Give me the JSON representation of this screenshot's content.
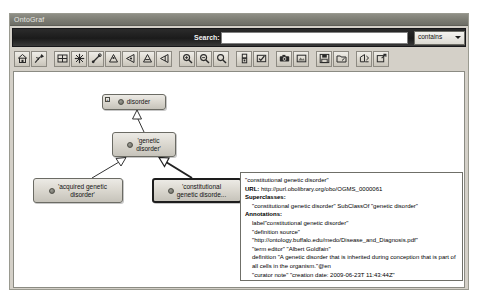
{
  "window": {
    "title": "OntoGraf"
  },
  "search": {
    "label": "Search:",
    "value": "",
    "placeholder": "",
    "match_mode": "contains",
    "match_options": [
      "contains",
      "starts with",
      "ends with",
      "exact match"
    ]
  },
  "toolbar": {
    "groups": [
      {
        "buttons": [
          {
            "name": "home-icon",
            "tip": "Home"
          },
          {
            "name": "pin-icon",
            "tip": "Pin"
          }
        ]
      },
      {
        "buttons": [
          {
            "name": "grid-layout-icon",
            "tip": "Grid layout"
          },
          {
            "name": "radial-layout-icon",
            "tip": "Radial layout"
          },
          {
            "name": "spring-layout-icon",
            "tip": "Spring layout"
          },
          {
            "name": "tree-vertical-layout-icon",
            "tip": "Vertical tree layout"
          },
          {
            "name": "tree-horizontal-layout-icon",
            "tip": "Horizontal tree layout"
          },
          {
            "name": "tree-vertical-alt-layout-icon",
            "tip": "Vertical tree alt layout"
          },
          {
            "name": "tree-horizontal-alt-layout-icon",
            "tip": "Horizontal tree alt layout"
          }
        ]
      },
      {
        "buttons": [
          {
            "name": "zoom-in-icon",
            "tip": "Zoom in"
          },
          {
            "name": "zoom-out-icon",
            "tip": "Zoom out"
          },
          {
            "name": "zoom-reset-icon",
            "tip": "Zoom reset"
          }
        ]
      },
      {
        "buttons": [
          {
            "name": "filter-icon",
            "tip": "Filters"
          },
          {
            "name": "select-tool-icon",
            "tip": "Selection"
          }
        ]
      },
      {
        "buttons": [
          {
            "name": "camera-icon",
            "tip": "Snapshot"
          },
          {
            "name": "export-image-icon",
            "tip": "Export image"
          }
        ]
      },
      {
        "buttons": [
          {
            "name": "save-icon",
            "tip": "Save"
          },
          {
            "name": "open-folder-icon",
            "tip": "Open"
          }
        ]
      },
      {
        "buttons": [
          {
            "name": "import-icon",
            "tip": "Import"
          },
          {
            "name": "share-icon",
            "tip": "Export"
          }
        ]
      }
    ]
  },
  "graph": {
    "nodes": [
      {
        "id": "disorder",
        "label": "disorder",
        "has_expander": true,
        "expander_glyph": "+",
        "selected": false,
        "x": 88,
        "y": 22,
        "w": 64,
        "h": 16
      },
      {
        "id": "genetic-disorder",
        "label": "'genetic\ndisorder'",
        "has_expander": false,
        "expander_glyph": "",
        "selected": false,
        "x": 98,
        "y": 60,
        "w": 64,
        "h": 24
      },
      {
        "id": "acquired-genetic-disorder",
        "label": "'acquired genetic\ndisorder'",
        "has_expander": false,
        "expander_glyph": "",
        "selected": false,
        "x": 19,
        "y": 106,
        "w": 88,
        "h": 24
      },
      {
        "id": "constitutional-genetic-disorder",
        "label": "'constitutional\ngenetic disorde...",
        "has_expander": false,
        "expander_glyph": "",
        "selected": true,
        "x": 138,
        "y": 106,
        "w": 88,
        "h": 24
      }
    ],
    "edges": [
      {
        "from": "genetic-disorder",
        "to": "disorder",
        "relation": "SubClassOf"
      },
      {
        "from": "acquired-genetic-disorder",
        "to": "genetic-disorder",
        "relation": "SubClassOf"
      },
      {
        "from": "constitutional-genetic-disorder",
        "to": "genetic-disorder",
        "relation": "SubClassOf"
      }
    ]
  },
  "tooltip": {
    "entity": "\"constitutional genetic disorder\"",
    "url_label": "URL:",
    "url": "http://purl.obolibrary.org/obo/OGMS_0000061",
    "superclasses_heading": "Superclasses:",
    "superclasses": [
      "\"constitutional genetic disorder\" SubClassOf \"genetic disorder\""
    ],
    "annotations_heading": "Annotations:",
    "annotations": [
      "label\"constitutional genetic disorder\"",
      "\"definition source\"",
      "\"http://ontology.buffalo.edu/medo/Disease_and_Diagnosis.pdf\"",
      "\"term editor\" \"Albert Goldfain\"",
      "definition \"A genetic disorder that is inherited during conception that is part of all cells in the organism.\"@en",
      "\"curator note\" \"creation date: 2009-06-23T 11:43:44Z\""
    ]
  },
  "colors": {
    "window_chrome": "#d4d0c8",
    "titlebar": "#7d7d74",
    "searchbar": "#1b1b1b",
    "canvas": "#ffffff",
    "node_fill": "#dcd9d1",
    "node_border": "#6b6b64",
    "selected_border": "#1d1d1d"
  }
}
